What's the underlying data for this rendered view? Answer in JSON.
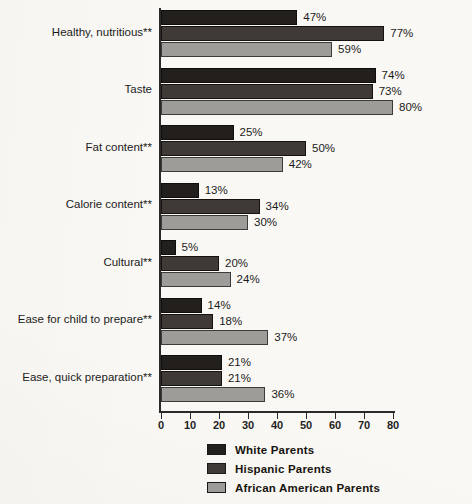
{
  "chart_data": {
    "type": "bar",
    "orientation": "horizontal",
    "title": "",
    "xlabel": "",
    "ylabel": "",
    "xlim": [
      0,
      80
    ],
    "grid": false,
    "legend_position": "bottom",
    "xticks": [
      0,
      10,
      20,
      30,
      40,
      50,
      60,
      70,
      80
    ],
    "xtick_labels": [
      "0",
      "10",
      "20",
      "30",
      "40",
      "50",
      "60",
      "70",
      "80"
    ],
    "categories": [
      "Healthy, nutritious**",
      "Taste",
      "Fat content**",
      "Calorie content**",
      "Cultural**",
      "Ease for child to prepare**",
      "Ease, quick preparation**"
    ],
    "series": [
      {
        "name": "White Parents",
        "color": "#231f1c",
        "values": [
          47,
          74,
          25,
          13,
          5,
          14,
          21
        ],
        "labels": [
          "47%",
          "74%",
          "25%",
          "13%",
          "5%",
          "14%",
          "21%"
        ]
      },
      {
        "name": "Hispanic Parents",
        "color": "#403a36",
        "values": [
          77,
          73,
          50,
          34,
          20,
          18,
          21
        ],
        "labels": [
          "77%",
          "73%",
          "50%",
          "34%",
          "20%",
          "18%",
          "21%"
        ]
      },
      {
        "name": "African American Parents",
        "color": "#9d9c99",
        "values": [
          59,
          80,
          42,
          30,
          24,
          37,
          36
        ],
        "labels": [
          "59%",
          "80%",
          "42%",
          "30%",
          "24%",
          "37%",
          "36%"
        ]
      }
    ]
  },
  "legend": {
    "items": [
      {
        "label": "White Parents",
        "color": "#231f1c"
      },
      {
        "label": "Hispanic Parents",
        "color": "#403a36"
      },
      {
        "label": "African American Parents",
        "color": "#9d9c99"
      }
    ]
  }
}
